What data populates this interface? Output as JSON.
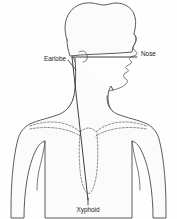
{
  "figure": {
    "background_color": "#fefefe",
    "outline_color": "#4a4a4a",
    "dashed_color": "#6d6d6d",
    "measure_line_color": "#2b2b2b",
    "label_color": "#1a1a1a",
    "width": 177,
    "height": 219
  },
  "labels": {
    "nose": "Nose",
    "earlobe": "Earlobe",
    "xyphoid": "Xyphoid"
  },
  "landmarks": [
    {
      "name": "nose",
      "label": "Nose",
      "x": 150,
      "y": 54
    },
    {
      "name": "earlobe",
      "label": "Earlobe",
      "x": 66,
      "y": 60
    },
    {
      "name": "xyphoid",
      "label": "Xyphoid",
      "x": 88,
      "y": 210
    }
  ],
  "measurement_path": {
    "description": "Nose to earlobe to xyphoid measurement line",
    "segments": [
      {
        "from": "nose",
        "to": "earlobe",
        "orientation": "horizontal"
      },
      {
        "from": "earlobe",
        "to": "xyphoid",
        "orientation": "vertical"
      }
    ]
  },
  "anatomy_parts": [
    "head-hair",
    "face-profile",
    "neck",
    "torso",
    "left-arm",
    "right-arm",
    "clavicle-dashed",
    "ribcage-dashed",
    "sternum-dashed"
  ]
}
